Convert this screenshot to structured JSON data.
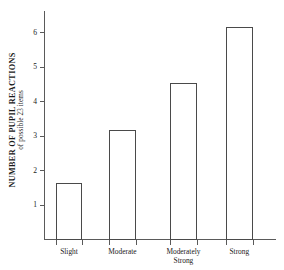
{
  "chart_data": {
    "type": "bar",
    "title": "",
    "subtitle": "",
    "ylabel": "NUMBER OF PUPIL REACTIONS",
    "ylabel_line2": "of possible 23 items",
    "xlabel": "",
    "categories": [
      "Slight",
      "Moderate",
      "Moderately\nStrong",
      "Strong"
    ],
    "values": [
      1.65,
      3.2,
      4.55,
      6.2
    ],
    "ylim": [
      0,
      6.65
    ],
    "yticks": [
      1,
      2,
      3,
      4,
      5,
      6
    ],
    "ytick_labels": [
      "1",
      "2",
      "3",
      "4",
      "5",
      "6"
    ],
    "grid": false,
    "legend": false,
    "legend_position": "none",
    "bar_fill_color": "#ffffff",
    "bar_edge_color": "#4a4a4a",
    "axis_color": "#5a5a5a",
    "background_color": "#ffffff"
  },
  "bars": [
    {
      "label": "Slight",
      "value": 1.65,
      "left_pct": 5.2,
      "width_pct": 11.2
    },
    {
      "label": "Moderate",
      "value": 3.2,
      "left_pct": 28.0,
      "width_pct": 11.6
    },
    {
      "label": "Moderately\nStrong",
      "value": 4.55,
      "left_pct": 54.3,
      "width_pct": 11.6
    },
    {
      "label": "Strong",
      "value": 6.2,
      "left_pct": 78.4,
      "width_pct": 11.6
    }
  ],
  "x_ticks_pct": [
    5.2,
    16.4,
    28.0,
    39.6,
    54.3,
    65.9,
    78.4,
    90.0
  ]
}
